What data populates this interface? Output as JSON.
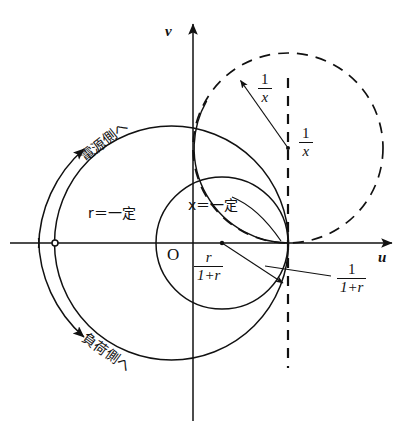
{
  "figure": {
    "type": "diagram",
    "background": "#ffffff",
    "ink": "#111111"
  },
  "axes": {
    "horizontal_label": "u",
    "vertical_label": "v",
    "origin_label": "O",
    "origin_px": {
      "x": 193,
      "y": 243
    },
    "x_axis": {
      "x1": 10,
      "y1": 243,
      "x2": 397,
      "y2": 243
    },
    "y_axis": {
      "x1": 193,
      "y1": 421,
      "x2": 193,
      "y2": 18
    }
  },
  "labels": {
    "r_constant": "r＝一定",
    "x_constant": "x＝一定",
    "to_source": "電源側へ",
    "to_load": "負荷側へ"
  },
  "fractions": {
    "one_over_x_upper": {
      "numerator": "1",
      "denominator": "x"
    },
    "one_over_x_lower": {
      "numerator": "1",
      "denominator": "x"
    },
    "r_over_one_plus_r": {
      "numerator": "r",
      "denominator": "1+r"
    },
    "one_over_one_plus_r": {
      "numerator": "1",
      "denominator": "1+r"
    }
  },
  "geometry": {
    "outer_circle": {
      "cx": 171.5,
      "cy": 243,
      "r": 117,
      "style": "solid",
      "name": "unit-reflection-circle"
    },
    "r_constant_circle": {
      "cx": 222,
      "cy": 243,
      "r": 66,
      "style": "solid",
      "name": "r-constant-circle"
    },
    "x_constant_circle": {
      "cx": 288,
      "cy": 148,
      "r": 95,
      "style": "dashed",
      "name": "x-constant-circle"
    },
    "tangent_point": {
      "x": 288,
      "y": 243
    },
    "left_marker": {
      "x": 55,
      "y": 243,
      "r": 3
    },
    "dashed_vertical": {
      "x": 288,
      "y1": 78,
      "y2": 368
    },
    "radius_arrow_one_over_x": {
      "x1": 288,
      "y1": 148,
      "x2": 239,
      "y2": 79
    },
    "radius_center_dot": {
      "x": 288,
      "y": 148
    },
    "r_center_dot": {
      "x": 222,
      "y": 243
    },
    "direction_arc_source": {
      "radius": 133,
      "from_deg": 182,
      "to_deg": 131,
      "arrow": "ccw"
    },
    "direction_arc_load": {
      "radius": 133,
      "from_deg": 178,
      "to_deg": 229,
      "arrow": "cw"
    }
  }
}
